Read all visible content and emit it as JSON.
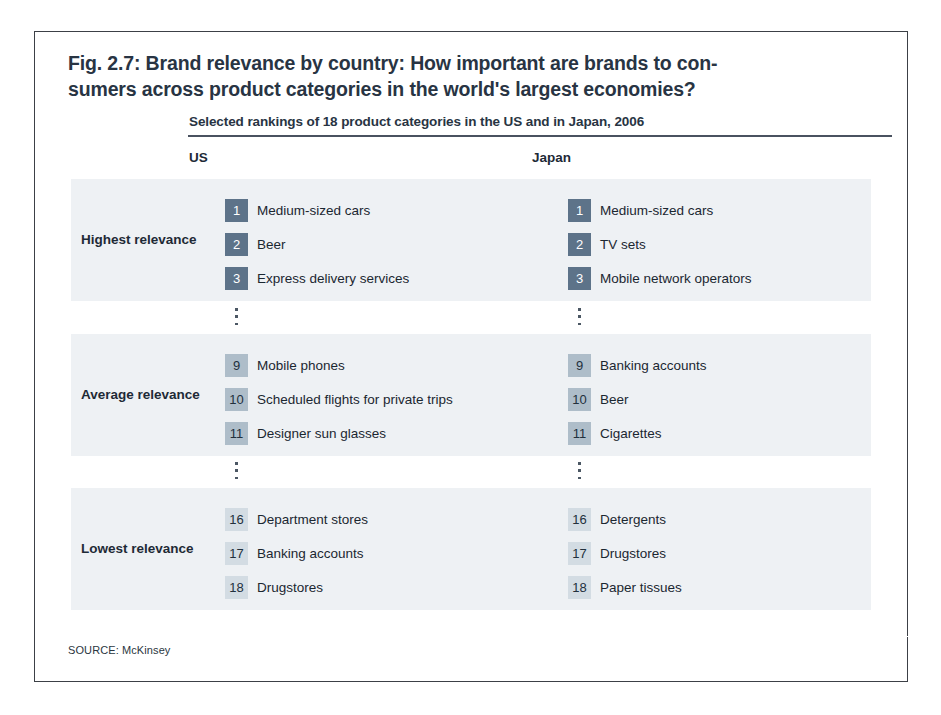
{
  "figure": {
    "title_lines": [
      "Fig. 2.7: Brand relevance by country: How important are brands to con-",
      "sumers across product categories in the world's largest economies?"
    ],
    "subtitle": "Selected rankings of 18 product categories in the US and in Japan, 2006",
    "source": "SOURCE: McKinsey",
    "colors": {
      "title": "#283443",
      "band": "#eef1f4",
      "rank_high": "#5d7389",
      "rank_mid": "#aebdc9",
      "rank_low": "#d3dce3",
      "frame": "#3c4046",
      "rule": "#4a5260"
    }
  },
  "columns": [
    {
      "key": "us",
      "label": "US"
    },
    {
      "key": "japan",
      "label": "Japan"
    }
  ],
  "chart_data": {
    "type": "table",
    "subtitle": "Selected rankings of 18 product categories in the US and in Japan, 2006",
    "columns": [
      "US",
      "Japan"
    ],
    "row_groups": [
      "Highest relevance",
      "Average relevance",
      "Lowest relevance"
    ],
    "total_categories": 18,
    "year": 2006,
    "source": "SOURCE: McKinsey",
    "groups": [
      {
        "label": "Highest relevance",
        "tier": "tier-high",
        "us": [
          {
            "rank": "1",
            "category": "Medium-sized cars"
          },
          {
            "rank": "2",
            "category": "Beer"
          },
          {
            "rank": "3",
            "category": "Express delivery services"
          }
        ],
        "japan": [
          {
            "rank": "1",
            "category": "Medium-sized cars"
          },
          {
            "rank": "2",
            "category": "TV sets"
          },
          {
            "rank": "3",
            "category": "Mobile network operators"
          }
        ]
      },
      {
        "label": "Average relevance",
        "tier": "tier-mid",
        "us": [
          {
            "rank": "9",
            "category": "Mobile phones"
          },
          {
            "rank": "10",
            "category": "Scheduled flights for private trips"
          },
          {
            "rank": "11",
            "category": "Designer sun glasses"
          }
        ],
        "japan": [
          {
            "rank": "9",
            "category": "Banking accounts"
          },
          {
            "rank": "10",
            "category": "Beer"
          },
          {
            "rank": "11",
            "category": "Cigarettes"
          }
        ]
      },
      {
        "label": "Lowest relevance",
        "tier": "tier-low",
        "us": [
          {
            "rank": "16",
            "category": "Department stores"
          },
          {
            "rank": "17",
            "category": "Banking accounts"
          },
          {
            "rank": "18",
            "category": "Drugstores"
          }
        ],
        "japan": [
          {
            "rank": "16",
            "category": "Detergents"
          },
          {
            "rank": "17",
            "category": "Drugstores"
          },
          {
            "rank": "18",
            "category": "Paper tissues"
          }
        ]
      }
    ]
  }
}
